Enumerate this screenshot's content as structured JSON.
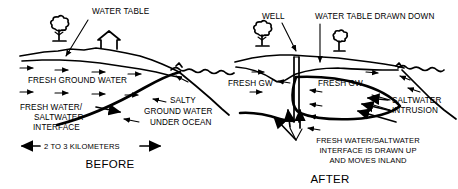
{
  "figure": {
    "title_alt": "Saltwater intrusion before and after well pumping",
    "background_color": "#ffffff",
    "ink_color": "#000000",
    "width": 458,
    "height": 189
  },
  "panels": [
    {
      "id": "before",
      "caption": "BEFORE",
      "scale_label": "2 TO 3 KILOMETERS",
      "labels": {
        "water_table": "WATER TABLE",
        "fresh_ground_water": "FRESH GROUND WATER",
        "interface_line1": "FRESH WATER/",
        "interface_line2": "SALTWATER",
        "interface_line3": "INTERFACE",
        "salty_line1": "SALTY",
        "salty_line2": "GROUND WATER",
        "salty_line3": "UNDER OCEAN"
      }
    },
    {
      "id": "after",
      "caption": "AFTER",
      "labels": {
        "well": "WELL",
        "water_table_drawn_down": "WATER TABLE DRAWN DOWN",
        "fresh_gw_left": "FRESH GW",
        "fresh_gw_right": "FRESH GW",
        "saltwater_intrusion_line1": "SALTWATER",
        "saltwater_intrusion_line2": "INTRUSION",
        "interface_line1": "FRESH WATER/SALTWATER",
        "interface_line2": "INTERFACE IS DRAWN UP",
        "interface_line3": "AND MOVES INLAND"
      }
    }
  ]
}
